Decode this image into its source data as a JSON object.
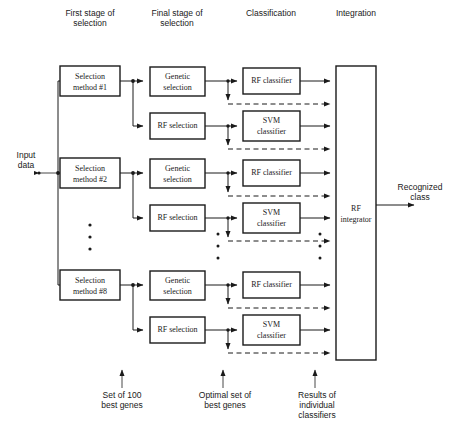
{
  "diagram": {
    "column_headers": [
      {
        "id": "first-stage",
        "label": "First stage of\nselection",
        "x": 90,
        "y": 8
      },
      {
        "id": "final-stage",
        "label": "Final stage of\nselection",
        "x": 177,
        "y": 8
      },
      {
        "id": "classification",
        "label": "Classification",
        "x": 271,
        "y": 8
      },
      {
        "id": "integration",
        "label": "Integration",
        "x": 356,
        "y": 8
      }
    ],
    "input": {
      "label": "Input\ndata",
      "x": 25,
      "y": 150
    },
    "output": {
      "label": "Recognized\nclass",
      "x": 419,
      "y": 182
    },
    "selection_methods": [
      {
        "id": "selection-method-1",
        "label": "Selection\nmethod #1",
        "cx": 90,
        "cy": 81
      },
      {
        "id": "selection-method-2",
        "label": "Selection\nmethod #2",
        "cx": 90,
        "cy": 173
      },
      {
        "id": "selection-method-8",
        "label": "Selection\nmethod #8",
        "cx": 90,
        "cy": 285
      }
    ],
    "final_selection": [
      {
        "id": "genetic-selection-1",
        "label": "Genetic\nselection",
        "cx": 177,
        "cy": 81
      },
      {
        "id": "rf-selection-1",
        "label": "RF selection",
        "cx": 177,
        "cy": 126
      },
      {
        "id": "genetic-selection-2",
        "label": "Genetic\nselection",
        "cx": 177,
        "cy": 173
      },
      {
        "id": "rf-selection-2",
        "label": "RF selection",
        "cx": 177,
        "cy": 218
      },
      {
        "id": "genetic-selection-8",
        "label": "Genetic\nselection",
        "cx": 177,
        "cy": 285
      },
      {
        "id": "rf-selection-8",
        "label": "RF selection",
        "cx": 177,
        "cy": 330
      }
    ],
    "classifiers": [
      {
        "id": "rf-classifier-1",
        "label": "RF classifier",
        "cx": 271,
        "cy": 81
      },
      {
        "id": "svm-classifier-1",
        "label": "SVM\nclassifier",
        "cx": 271,
        "cy": 126
      },
      {
        "id": "rf-classifier-2",
        "label": "RF classifier",
        "cx": 271,
        "cy": 173
      },
      {
        "id": "svm-classifier-2",
        "label": "SVM\nclassifier",
        "cx": 271,
        "cy": 218
      },
      {
        "id": "rf-classifier-8",
        "label": "RF classifier",
        "cx": 271,
        "cy": 285
      },
      {
        "id": "svm-classifier-8",
        "label": "SVM\nclassifier",
        "cx": 271,
        "cy": 330
      }
    ],
    "integrator": {
      "id": "rf-integrator",
      "label": "RF\nintegrator",
      "x": 336,
      "y": 66,
      "width": 40,
      "height": 294
    },
    "annotations": [
      {
        "id": "set-of-100-best-genes",
        "label": "Set of 100\nbest genes",
        "x": 122,
        "y": 392,
        "arrow_x": 122,
        "arrow_top": 370,
        "arrow_bottom": 388
      },
      {
        "id": "optimal-set-of-best-genes",
        "label": "Optimal set of\nbest genes",
        "x": 223,
        "y": 392,
        "arrow_x": 223,
        "arrow_top": 370,
        "arrow_bottom": 388
      },
      {
        "id": "results-of-individual-classifiers",
        "label": "Results of\nindividual\nclassifiers",
        "x": 315,
        "y": 392,
        "arrow_x": 315,
        "arrow_top": 370,
        "arrow_bottom": 388
      }
    ],
    "ellipsis_columns": [
      {
        "id": "ellipsis-selection-column",
        "x": 90,
        "ys": [
          225,
          237,
          249
        ]
      },
      {
        "id": "ellipsis-final-column",
        "x": 218,
        "ys": [
          234,
          246,
          258
        ]
      },
      {
        "id": "ellipsis-classification-column",
        "x": 320,
        "ys": [
          234,
          246,
          258
        ]
      }
    ],
    "colors": {
      "stroke": "#1a1a1a",
      "background": "#ffffff",
      "box_fill": "#ffffff"
    }
  }
}
